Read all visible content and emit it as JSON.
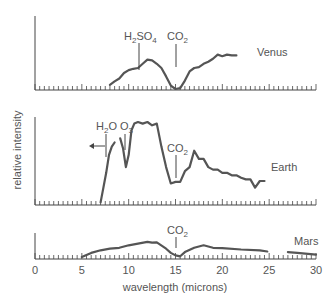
{
  "chart_data": {
    "type": "line",
    "title": "",
    "xlabel": "wavelength (microns)",
    "ylabel": "relative intensity",
    "xlim": [
      0,
      30
    ],
    "x_ticks": [
      0,
      5,
      10,
      15,
      20,
      25,
      30
    ],
    "grid": false,
    "legend": "inline labels at right of each curve",
    "panels": [
      {
        "name": "Venus",
        "label": "Venus",
        "annotations": [
          {
            "text": "H2SO4",
            "x": 11
          },
          {
            "text": "CO2",
            "x": 15
          }
        ],
        "x": [
          8,
          8.5,
          9,
          9.5,
          10,
          10.5,
          11,
          11.5,
          12,
          12.5,
          13,
          13.5,
          14,
          14.5,
          15,
          15.5,
          16,
          16.5,
          17,
          17.5,
          18,
          18.5,
          19,
          19.5,
          20,
          20.5,
          21,
          21.5
        ],
        "y": [
          0.1,
          0.18,
          0.25,
          0.38,
          0.45,
          0.48,
          0.5,
          0.6,
          0.7,
          0.68,
          0.6,
          0.5,
          0.3,
          0.08,
          0.0,
          0.02,
          0.2,
          0.42,
          0.5,
          0.52,
          0.6,
          0.65,
          0.72,
          0.82,
          0.78,
          0.82,
          0.8,
          0.8
        ]
      },
      {
        "name": "Earth",
        "label": "Earth",
        "annotations": [
          {
            "text": "H2O",
            "x": 7.5,
            "arrow": "left"
          },
          {
            "text": "O3",
            "x": 9.6
          },
          {
            "text": "CO2",
            "x": 15
          }
        ],
        "x": [
          7,
          7.3,
          7.6,
          7.9,
          8.2,
          8.5,
          8.8,
          9.1,
          9.4,
          9.7,
          10,
          10.3,
          10.6,
          11,
          11.5,
          12,
          12.5,
          13,
          13.5,
          14,
          14.5,
          15,
          15.5,
          16,
          16.5,
          17,
          17.5,
          18,
          18.5,
          19,
          19.5,
          20,
          20.5,
          21,
          21.5,
          22,
          22.5,
          23,
          23.5,
          24,
          24.5
        ],
        "y": [
          0.02,
          0.2,
          0.38,
          0.6,
          0.7,
          0.75,
          null,
          0.8,
          0.68,
          0.45,
          0.6,
          0.9,
          0.98,
          1.0,
          0.98,
          1.0,
          0.96,
          0.98,
          0.7,
          0.45,
          0.25,
          0.27,
          0.27,
          0.4,
          0.45,
          0.65,
          0.55,
          0.55,
          0.45,
          0.42,
          0.42,
          0.38,
          0.38,
          0.35,
          0.35,
          0.32,
          0.3,
          0.3,
          0.2,
          0.28,
          0.28
        ]
      },
      {
        "name": "Mars",
        "label": "Mars",
        "annotations": [
          {
            "text": "CO2",
            "x": 15
          }
        ],
        "x": [
          5,
          6,
          7,
          8,
          9,
          10,
          11,
          12,
          12.5,
          13,
          14,
          14.5,
          15,
          15.5,
          16,
          17,
          18,
          19,
          20,
          22,
          24,
          24.8,
          25.5,
          27,
          28,
          30
        ],
        "y": [
          0.05,
          0.3,
          0.45,
          0.55,
          0.6,
          0.75,
          0.85,
          0.95,
          0.9,
          0.92,
          0.55,
          0.3,
          0.15,
          0.1,
          0.35,
          0.6,
          0.75,
          0.6,
          0.58,
          0.5,
          0.45,
          0.38,
          null,
          0.35,
          0.3,
          0.2
        ]
      }
    ]
  },
  "labels": {
    "ylabel": "relative intensity",
    "xlabel": "wavelength (microns)",
    "venus": "Venus",
    "earth": "Earth",
    "mars": "Mars",
    "h2so4_main": "H",
    "h2so4_sub": "2",
    "h2so4_rest": "SO",
    "h2so4_sub2": "4",
    "co2_main": "CO",
    "co2_sub": "2",
    "h2o_main": "H",
    "h2o_sub": "2",
    "h2o_rest": "O",
    "o3_main": "O",
    "o3_sub": "3",
    "ticks": [
      "0",
      "5",
      "10",
      "15",
      "20",
      "25",
      "30"
    ]
  },
  "colors": {
    "curve": "#555555",
    "axis": "#444444",
    "text": "#555555"
  }
}
